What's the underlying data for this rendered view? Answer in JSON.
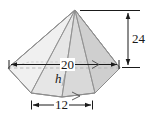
{
  "figure": {
    "kind": "geometry-diagram",
    "shape_name": "hexagonal-pyramid",
    "colors": {
      "outline": "#8c8c8c",
      "hidden_line": "#b0b0b0",
      "dimension_line": "#1a1a1a",
      "label_text": "#1a1a1a",
      "face_lightest": "#f2f2f2",
      "face_light": "#e8e8e8",
      "face_mid": "#dedede",
      "face_dark": "#d2d2d2",
      "face_darkest": "#c8c8c8",
      "background": "#ffffff"
    },
    "dimensions": [
      {
        "id": "width-20",
        "label": "20",
        "value": 20,
        "orientation": "horizontal",
        "placement": "across-base-width",
        "arrowheads": "both-ends",
        "tick_mark": ">"
      },
      {
        "id": "height-24",
        "label": "24",
        "value": 24,
        "orientation": "vertical",
        "placement": "right-side-apex-to-base",
        "arrowheads": "both-ends",
        "tick_mark": ""
      },
      {
        "id": "depth-12",
        "label": "12",
        "value": 12,
        "orientation": "horizontal",
        "placement": "below-front-base-edge",
        "arrowheads": "both-ends",
        "tick_mark": ">"
      }
    ],
    "variables": [
      {
        "id": "slant-h",
        "label": "h",
        "style": "italic",
        "meaning": "altitude segment marked with right-angle symbol"
      }
    ],
    "markers": [
      {
        "id": "right-angle",
        "glyph": "square",
        "meaning": "perpendicular"
      }
    ]
  }
}
